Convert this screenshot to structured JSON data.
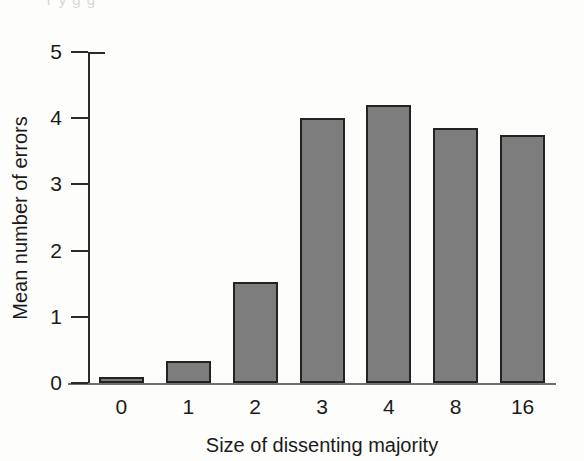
{
  "figure": {
    "background_color": "#fdfdfc",
    "bar_fill_color": "#7d7d7d",
    "bar_edge_color": "#232323",
    "axis_color": "#2b2b2b",
    "scan_artifact_text": "T   y   g   g"
  },
  "chart_data": {
    "type": "bar",
    "title": "",
    "subtitle": "",
    "xlabel": "Size of dissenting majority",
    "ylabel": "Mean number of errors",
    "categories": [
      "0",
      "1",
      "2",
      "3",
      "4",
      "8",
      "16"
    ],
    "values": [
      0.09,
      0.33,
      1.53,
      4.0,
      4.2,
      3.85,
      3.75
    ],
    "series": [
      {
        "name": "Mean number of errors",
        "values": [
          0.09,
          0.33,
          1.53,
          4.0,
          4.2,
          3.85,
          3.75
        ]
      }
    ],
    "ylim": [
      0,
      5
    ],
    "xlim_categorical": true,
    "yticks": [
      0,
      1,
      2,
      3,
      4,
      5
    ],
    "ytick_labels": [
      "0",
      "1",
      "2",
      "3",
      "4",
      "5"
    ],
    "xtick_labels": [
      "0",
      "1",
      "2",
      "3",
      "4",
      "8",
      "16"
    ],
    "grid": false,
    "legend": null,
    "legend_position": "none",
    "annotations": []
  }
}
